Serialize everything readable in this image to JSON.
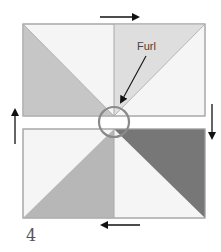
{
  "diagram": {
    "step_number": "4",
    "annotation": "Furl",
    "colors": {
      "top_left_triangle": "#c6c6c6",
      "top_right_triangle": "#dedede",
      "bottom_left_triangle": "#b7b7b7",
      "bottom_right_triangle": "#777777",
      "light_fill": "#f5f5f5",
      "outline": "#a8a8a8",
      "circle": "#8a8a8a",
      "arrow": "#111111"
    },
    "arrows": [
      {
        "position": "top",
        "direction": "right"
      },
      {
        "position": "right",
        "direction": "down"
      },
      {
        "position": "bottom",
        "direction": "left"
      },
      {
        "position": "left",
        "direction": "up"
      }
    ]
  }
}
